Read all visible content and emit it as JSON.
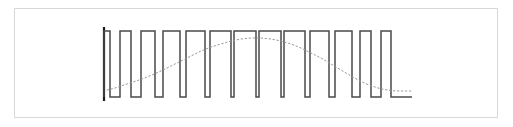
{
  "figure": {
    "name": "pwm-waveform-figure",
    "frame": {
      "x": 14,
      "y": 8,
      "width": 484,
      "height": 110,
      "border_color": "#d8d8d8",
      "background_color": "#ffffff"
    }
  },
  "colors": {
    "pulse_stroke": "#4a4a4a",
    "sine_stroke": "#9a9a9a",
    "marker_stroke": "#1a1a1a",
    "frame_border": "#d8d8d8",
    "background": "#ffffff"
  },
  "chart_data": {
    "type": "line",
    "title": "",
    "subtitle": "",
    "xlabel": "",
    "ylabel": "",
    "xlim": [
      100,
      418
    ],
    "ylim": [
      31,
      97
    ],
    "grid": false,
    "legend": null,
    "annotations": [],
    "axis_ticks": {
      "x": [],
      "y": []
    },
    "geometry": {
      "baseline_y": 97,
      "top_y": 31,
      "start_x": 104,
      "end_x": 412,
      "pulse_count": 13
    },
    "series": [
      {
        "name": "start-marker",
        "type": "line",
        "style": "solid",
        "stroke": "#1a1a1a",
        "stroke_width": 2.2,
        "points": [
          [
            104,
            27
          ],
          [
            104,
            101
          ]
        ]
      },
      {
        "name": "pwm-pulse-train",
        "type": "step",
        "style": "solid",
        "stroke": "#4a4a4a",
        "stroke_width": 1.5,
        "points": [
          [
            104,
            97
          ],
          [
            104,
            31
          ],
          [
            110,
            31
          ],
          [
            110,
            97
          ],
          [
            120,
            97
          ],
          [
            120,
            31
          ],
          [
            131,
            31
          ],
          [
            131,
            97
          ],
          [
            141,
            97
          ],
          [
            141,
            31
          ],
          [
            155,
            31
          ],
          [
            155,
            97
          ],
          [
            163,
            97
          ],
          [
            163,
            31
          ],
          [
            180,
            31
          ],
          [
            180,
            97
          ],
          [
            186,
            97
          ],
          [
            186,
            31
          ],
          [
            205,
            31
          ],
          [
            205,
            97
          ],
          [
            210,
            97
          ],
          [
            210,
            31
          ],
          [
            231,
            31
          ],
          [
            231,
            97
          ],
          [
            234,
            97
          ],
          [
            234,
            31
          ],
          [
            256,
            31
          ],
          [
            256,
            97
          ],
          [
            259,
            97
          ],
          [
            259,
            31
          ],
          [
            281,
            31
          ],
          [
            281,
            97
          ],
          [
            284,
            97
          ],
          [
            284,
            31
          ],
          [
            305,
            31
          ],
          [
            305,
            97
          ],
          [
            310,
            97
          ],
          [
            310,
            31
          ],
          [
            329,
            31
          ],
          [
            329,
            97
          ],
          [
            335,
            97
          ],
          [
            335,
            31
          ],
          [
            352,
            31
          ],
          [
            352,
            97
          ],
          [
            360,
            97
          ],
          [
            360,
            31
          ],
          [
            371,
            31
          ],
          [
            371,
            97
          ],
          [
            381,
            97
          ],
          [
            381,
            31
          ],
          [
            391,
            31
          ],
          [
            391,
            97
          ],
          [
            412,
            97
          ]
        ]
      },
      {
        "name": "sine-reference",
        "type": "line",
        "style": "dotted",
        "stroke": "#9a9a9a",
        "stroke_width": 1,
        "dash_pattern": "1.5 2.5",
        "points": [
          [
            107,
            90
          ],
          [
            115,
            88
          ],
          [
            124,
            85
          ],
          [
            133,
            82
          ],
          [
            142,
            79
          ],
          [
            152,
            75
          ],
          [
            161,
            71
          ],
          [
            171,
            66
          ],
          [
            181,
            61
          ],
          [
            191,
            56
          ],
          [
            201,
            51
          ],
          [
            211,
            47
          ],
          [
            221,
            44
          ],
          [
            231,
            41
          ],
          [
            241,
            39
          ],
          [
            251,
            38
          ],
          [
            261,
            38
          ],
          [
            271,
            39
          ],
          [
            281,
            41
          ],
          [
            291,
            44
          ],
          [
            301,
            48
          ],
          [
            311,
            53
          ],
          [
            321,
            58
          ],
          [
            331,
            64
          ],
          [
            341,
            70
          ],
          [
            351,
            76
          ],
          [
            360,
            81
          ],
          [
            369,
            85
          ],
          [
            378,
            88
          ],
          [
            387,
            90
          ],
          [
            396,
            91
          ],
          [
            405,
            91
          ],
          [
            412,
            91
          ]
        ]
      }
    ]
  }
}
